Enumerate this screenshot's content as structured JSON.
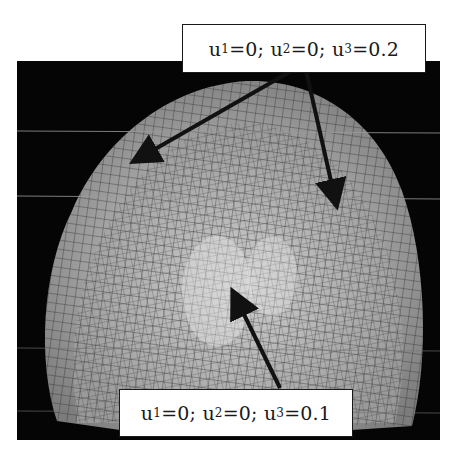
{
  "figure": {
    "type": "finite-element mesh of palate/denture surface with boundary condition annotations",
    "background_color": "#050505",
    "mesh_color": "#b8b8b8"
  },
  "annotations": {
    "top": {
      "u1_label": "u",
      "u1_sub": "1",
      "u1_value": "=0; ",
      "u2_label": "u",
      "u2_sub": "2",
      "u2_value": "=0; ",
      "u3_label": "u",
      "u3_sub": "3",
      "u3_value": "=0.2",
      "full_text": "u1=0; u2=0; u3=0.2",
      "arrow_count": 2
    },
    "bottom": {
      "u1_label": "u",
      "u1_sub": "1",
      "u1_value": "=0; ",
      "u2_label": "u",
      "u2_sub": "2",
      "u2_value": "=0; ",
      "u3_label": "u",
      "u3_sub": "3",
      "u3_value": "=0.1",
      "full_text": "u1=0; u2=0; u3=0.1",
      "arrow_count": 1
    }
  }
}
